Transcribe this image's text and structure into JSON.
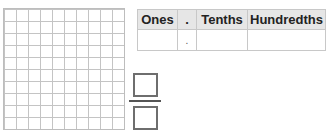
{
  "grid": {
    "rows": 10,
    "cols": 10
  },
  "place_value_table": {
    "headers": [
      "Ones",
      ".",
      "Tenths",
      "Hundredths"
    ],
    "row": [
      "",
      ".",
      "",
      ""
    ]
  },
  "fraction": {
    "numerator": "",
    "denominator": ""
  }
}
